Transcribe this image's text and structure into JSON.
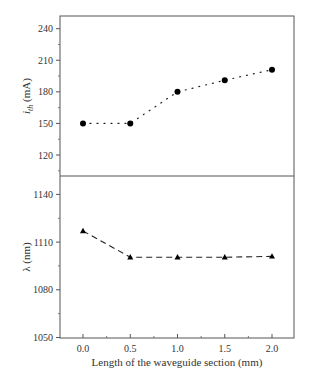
{
  "chart_data": [
    {
      "type": "line",
      "panel": "top",
      "title": "",
      "xlabel": "",
      "ylabel": "i_th (mA)",
      "ylabel_main": "i",
      "ylabel_sub": "th",
      "ylabel_unit": " (mA)",
      "x": [
        0.0,
        0.5,
        1.0,
        1.5,
        2.0
      ],
      "series": [
        {
          "name": "threshold current",
          "marker": "circle",
          "linestyle": "dotted",
          "values": [
            150,
            150,
            180,
            191,
            201
          ]
        }
      ],
      "ylim": [
        100,
        250
      ],
      "yticks": [
        120,
        150,
        180,
        210,
        240
      ],
      "yticks_minor": [
        105,
        135,
        165,
        195,
        225
      ],
      "grid": false
    },
    {
      "type": "line",
      "panel": "bottom",
      "title": "",
      "xlabel": "Length of the waveguide section (mm)",
      "ylabel": "λ (nm)",
      "x": [
        0.0,
        0.5,
        1.0,
        1.5,
        2.0
      ],
      "series": [
        {
          "name": "wavelength",
          "marker": "triangle",
          "linestyle": "dashed",
          "values": [
            1117,
            1100.5,
            1100.5,
            1100.5,
            1101
          ]
        }
      ],
      "xlim": [
        -0.25,
        2.25
      ],
      "xticks": [
        "0.0",
        "0.5",
        "1.0",
        "1.5",
        "2.0"
      ],
      "ylim": [
        1050,
        1150
      ],
      "yticks": [
        1050,
        1080,
        1110,
        1140
      ],
      "yticks_minor": [
        1065,
        1095,
        1125
      ],
      "grid": false
    }
  ]
}
